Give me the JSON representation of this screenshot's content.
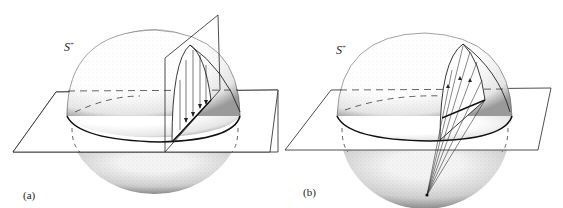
{
  "figure": {
    "panels": [
      {
        "id": "a",
        "panel_label": "(a)",
        "sphere_label": "S",
        "sphere_label_sup": "+",
        "description": "Upper hemisphere S+ cut by a horizontal plane and a vertical plane; vertical arrows project points of a meridian arc down onto the plane"
      },
      {
        "id": "b",
        "panel_label": "(b)",
        "sphere_label": "S",
        "sphere_label_sup": "+",
        "description": "Upper hemisphere S+ cut by a horizontal plane; arrows project points of a meridian arc toward the south pole of the sphere"
      }
    ],
    "colors": {
      "ink": "#222222",
      "stipple": "#555555",
      "background": "#ffffff"
    }
  }
}
